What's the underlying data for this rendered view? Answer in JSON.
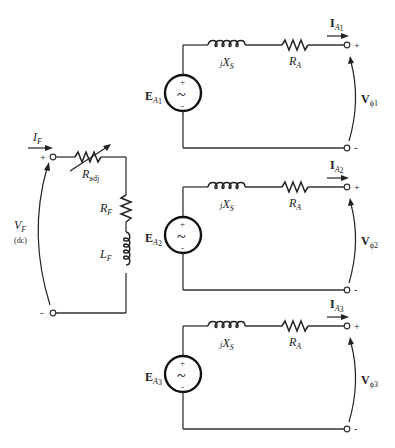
{
  "field_circuit": {
    "current_label": "I",
    "current_sub": "F",
    "voltage_label": "V",
    "voltage_sub": "F",
    "voltage_note": "(dc)",
    "plus_sign": "+",
    "minus_sign": "-",
    "rheostat_label": "R",
    "rheostat_sub": "adj",
    "resistor_label": "R",
    "resistor_sub": "F",
    "inductor_label": "L",
    "inductor_sub": "F"
  },
  "phases": [
    {
      "source_label": "E",
      "source_sub": "A",
      "source_index": "1",
      "reactance_prefix": "j",
      "reactance_label": "X",
      "reactance_sub": "S",
      "resistance_label": "R",
      "resistance_sub": "A",
      "current_label": "I",
      "current_sub": "A",
      "current_index": "1",
      "voltage_label": "V",
      "voltage_sub": "ϕ",
      "voltage_index": "1",
      "plus_sign": "+",
      "minus_sign": "-"
    },
    {
      "source_label": "E",
      "source_sub": "A",
      "source_index": "2",
      "reactance_prefix": "j",
      "reactance_label": "X",
      "reactance_sub": "S",
      "resistance_label": "R",
      "resistance_sub": "A",
      "current_label": "I",
      "current_sub": "A",
      "current_index": "2",
      "voltage_label": "V",
      "voltage_sub": "ϕ",
      "voltage_index": "2",
      "plus_sign": "+",
      "minus_sign": "-"
    },
    {
      "source_label": "E",
      "source_sub": "A",
      "source_index": "3",
      "reactance_prefix": "j",
      "reactance_label": "X",
      "reactance_sub": "S",
      "resistance_label": "R",
      "resistance_sub": "A",
      "current_label": "I",
      "current_sub": "A",
      "current_index": "3",
      "voltage_label": "V",
      "voltage_sub": "ϕ",
      "voltage_index": "3",
      "plus_sign": "+",
      "minus_sign": "-"
    }
  ],
  "source_symbol": {
    "plus": "+",
    "minus": "-",
    "ac": "~"
  }
}
